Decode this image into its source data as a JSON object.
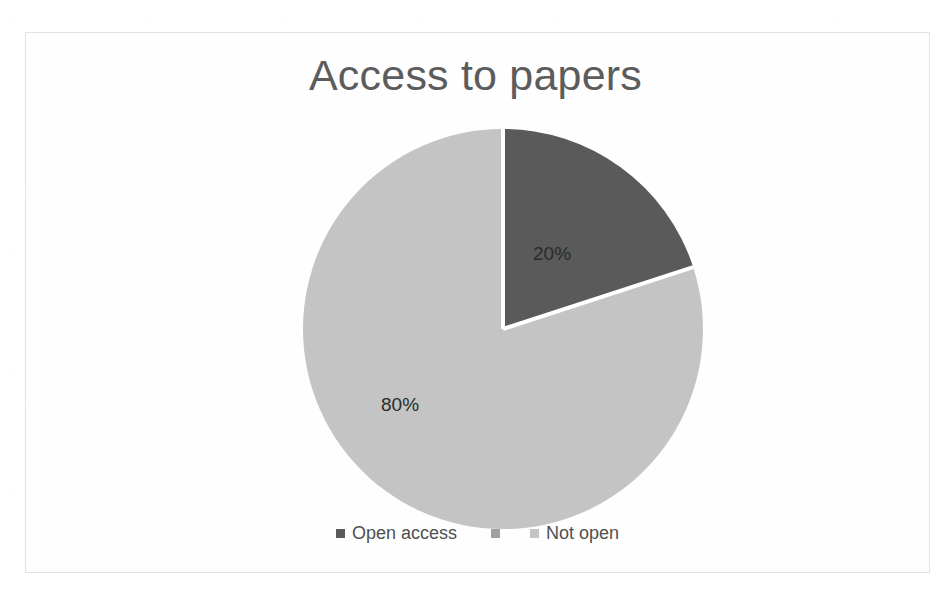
{
  "chart_data": {
    "type": "pie",
    "title": "Access to papers",
    "categories": [
      "Open access",
      "",
      "Not open"
    ],
    "values": [
      20,
      null,
      80
    ],
    "data_labels": [
      "20%",
      "80%"
    ],
    "legend_position": "bottom",
    "grid": false,
    "xlabel": "",
    "ylabel": "",
    "slices": [
      {
        "label": "Open access",
        "value": 20,
        "data_label": "20%",
        "color": "#5a5a5a",
        "start_angle_deg": 0,
        "end_angle_deg": 72
      },
      {
        "label": "Not open",
        "value": 80,
        "data_label": "80%",
        "color": "#c4c4c4",
        "start_angle_deg": 72,
        "end_angle_deg": 360
      }
    ]
  },
  "chart": {
    "title": "Access to papers",
    "slice_label_open": "20%",
    "slice_label_not_open": "80%",
    "separator_color": "#ffffff",
    "frame_color": "#e2e2e2"
  },
  "legend": {
    "items": [
      {
        "label": "Open access",
        "color": "#5a5a5a"
      },
      {
        "label": "",
        "color": "#a0a0a0"
      },
      {
        "label": "Not open",
        "color": "#c4c4c4"
      }
    ]
  }
}
